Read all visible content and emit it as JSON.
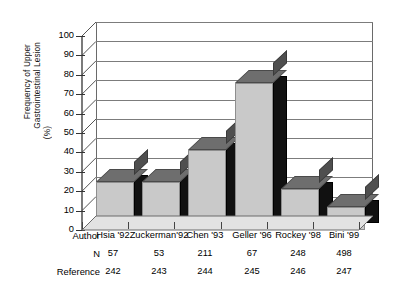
{
  "chart_data": {
    "type": "bar",
    "title": "",
    "xlabel": "Author",
    "ylabel": "Frequency of Upper Gastrointestinal Lesion (%)",
    "ylabel_lines": [
      "Frequency of  Upper",
      "Gastrointestinal Lesion",
      "(%)"
    ],
    "ylim": [
      0,
      100
    ],
    "ytick_values": [
      0,
      10,
      20,
      30,
      40,
      50,
      60,
      70,
      80,
      90,
      100
    ],
    "ytick_labels": [
      "0",
      "10",
      "20",
      "30",
      "40",
      "50",
      "60",
      "70",
      "80",
      "90",
      "100"
    ],
    "grid": true,
    "legend": "none",
    "style": "3d-column",
    "categories": [
      "Hsia '92",
      "Zuckerman'92",
      "Chen '93",
      "Geller '96",
      "Rockey '98",
      "Bini '99"
    ],
    "values": [
      25,
      25,
      41,
      76,
      21,
      12
    ],
    "series": [
      {
        "name": "Frequency of Upper Gastrointestinal Lesion (%)",
        "values": [
          25,
          25,
          41,
          76,
          21,
          12
        ]
      }
    ],
    "annotations": {
      "row_headers": [
        "Author",
        "N",
        "Reference"
      ],
      "n_values": [
        "57",
        "53",
        "211",
        "67",
        "248",
        "498"
      ],
      "reference_values": [
        "242",
        "243",
        "244",
        "245",
        "246",
        "247"
      ]
    },
    "colors": {
      "bar_front": "#c9c9c9",
      "bar_top": "#6e6e6e",
      "bar_side": "#111111",
      "grid": "#7c7c7c",
      "axis": "#333333",
      "background": "#ffffff"
    }
  },
  "table": {
    "rows": [
      {
        "label": "Author",
        "cells": [
          "Hsia '92",
          "Zuckerman'92",
          "Chen '93",
          "Geller '96",
          "Rockey '98",
          "Bini '99"
        ]
      },
      {
        "label": "N",
        "cells": [
          "57",
          "53",
          "211",
          "67",
          "248",
          "498"
        ]
      },
      {
        "label": "Reference",
        "cells": [
          "242",
          "243",
          "244",
          "245",
          "246",
          "247"
        ]
      }
    ]
  }
}
